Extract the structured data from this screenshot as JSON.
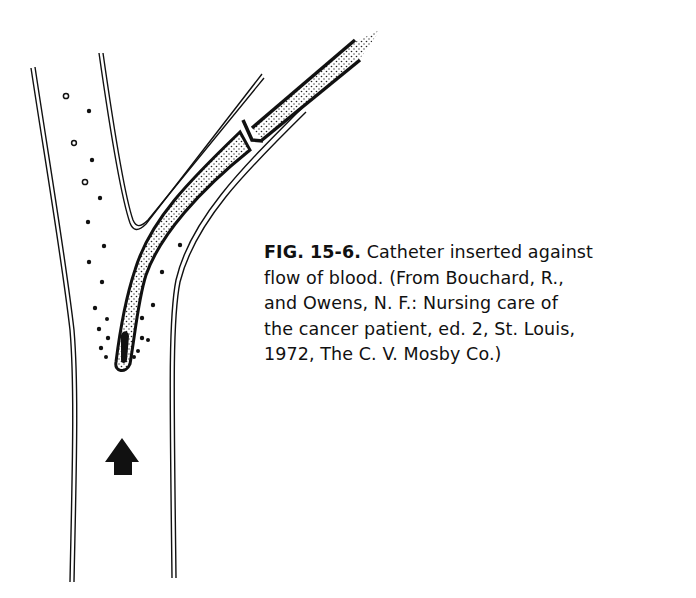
{
  "figure": {
    "label": "FIG. 15-6.",
    "caption_lines": [
      " Catheter inserted against",
      "flow of blood. (From Bouchard, R.,",
      "and Owens, N. F.: Nursing care of",
      "the cancer patient, ed. 2, St. Louis,",
      "1972, The C. V. Mosby Co.)"
    ],
    "diagram": {
      "subject": "Catheter inserted into vein branch against direction of blood flow",
      "elements": [
        "vessel-walls",
        "catheter",
        "insertion-arrow",
        "blood-flow-arrow",
        "blood-cells",
        "clot-at-tip"
      ],
      "ink_color": "#111111",
      "background_color": "#ffffff"
    }
  }
}
